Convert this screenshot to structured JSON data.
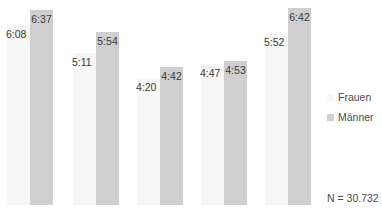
{
  "chart_data": {
    "type": "bar",
    "title": "",
    "xlabel": "",
    "ylabel": "",
    "categories": [
      "",
      "",
      "",
      "",
      ""
    ],
    "series": [
      {
        "name": "Frauen",
        "color": "#f6f6f6",
        "labels": [
          "6:08",
          "5:11",
          "4:20",
          "4:47",
          "5:52"
        ],
        "values_minutes": [
          368,
          311,
          260,
          287,
          352
        ]
      },
      {
        "name": "Männer",
        "color": "#cfcfcf",
        "labels": [
          "6:37",
          "5:54",
          "4:42",
          "4:53",
          "6:42"
        ],
        "values_minutes": [
          397,
          354,
          282,
          293,
          402
        ]
      }
    ],
    "ylim": [
      0,
      402
    ],
    "grid": false,
    "legend_position": "right",
    "annotation": "N = 30.732"
  },
  "legend": {
    "frauen": "Frauen",
    "maenner": "Männer"
  },
  "note": "N = 30.732"
}
